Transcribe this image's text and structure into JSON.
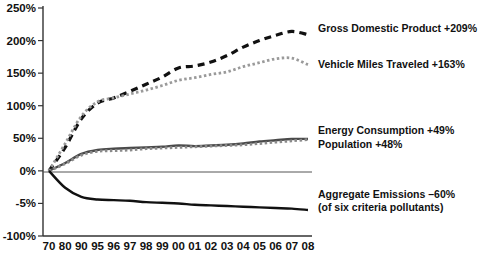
{
  "chart_data": {
    "type": "line",
    "title": "",
    "xlabel": "",
    "ylabel": "",
    "grid": false,
    "legend_position": "inline-right",
    "categories": [
      "70",
      "80",
      "90",
      "95",
      "96",
      "97",
      "98",
      "99",
      "00",
      "01",
      "02",
      "03",
      "04",
      "05",
      "06",
      "07",
      "08"
    ],
    "ytick_labels": [
      "250%",
      "200%",
      "150%",
      "100%",
      "50%",
      "0%",
      "-5%",
      "-100%"
    ],
    "ytick_values": [
      250,
      200,
      150,
      100,
      50,
      0,
      -50,
      -100
    ],
    "ylim": [
      -100,
      250
    ],
    "series": [
      {
        "name": "Gross Domestic Product",
        "label": "Gross Domestic Product +209%",
        "delta": "+209%",
        "color": "#111111",
        "style": "dashed",
        "values": [
          0,
          36,
          80,
          104,
          112,
          122,
          133,
          144,
          158,
          161,
          167,
          177,
          190,
          200,
          208,
          214,
          209
        ]
      },
      {
        "name": "Vehicle Miles Traveled",
        "label": "Vehicle Miles Traveled +163%",
        "delta": "+163%",
        "color": "#9a9a9a",
        "style": "dotted",
        "values": [
          0,
          42,
          84,
          106,
          112,
          118,
          124,
          131,
          139,
          143,
          148,
          152,
          160,
          166,
          172,
          173,
          163
        ]
      },
      {
        "name": "Energy Consumption",
        "label": "Energy Consumption +49%",
        "delta": "+49%",
        "color": "#4a4a4a",
        "style": "solid",
        "values": [
          0,
          12,
          26,
          32,
          34,
          35,
          36,
          37,
          39,
          38,
          39,
          40,
          42,
          45,
          47,
          49,
          49
        ]
      },
      {
        "name": "Population",
        "label": "Population +48%",
        "delta": "+48%",
        "color": "#8a8a8a",
        "style": "dotted",
        "values": [
          0,
          11,
          24,
          30,
          31,
          32,
          34,
          35,
          36,
          37,
          38,
          39,
          40,
          42,
          44,
          46,
          48
        ]
      },
      {
        "name": "Aggregate Emissions",
        "label": "Aggregate Emissions –60%",
        "sublabel": "(of six criteria pollutants)",
        "delta": "–60%",
        "color": "#111111",
        "style": "solid",
        "values": [
          0,
          -26,
          -40,
          -44,
          -45,
          -46,
          -48,
          -49,
          -50,
          -52,
          -53,
          -54,
          -55,
          -56,
          -57,
          -58,
          -60
        ]
      }
    ]
  }
}
